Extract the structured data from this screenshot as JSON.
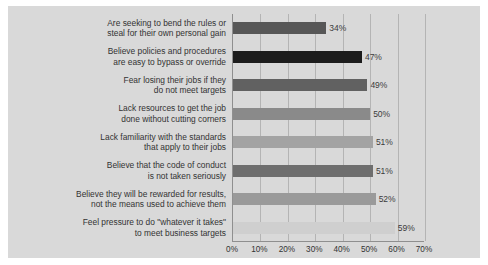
{
  "chart_data": {
    "type": "bar",
    "orientation": "horizontal",
    "title": "",
    "subtitle": "",
    "xlabel": "",
    "ylabel": "",
    "xlim": [
      0,
      70
    ],
    "grid": true,
    "legend": false,
    "xticks": [
      "0%",
      "10%",
      "20%",
      "30%",
      "40%",
      "50%",
      "60%",
      "70%"
    ],
    "xtick_values": [
      0,
      10,
      20,
      30,
      40,
      50,
      60,
      70
    ],
    "categories": [
      "Are seeking to bend the rules or steal for their own personal gain",
      "Believe policies and procedures are easy to bypass or override",
      "Fear losing their jobs if they do not meet targets",
      "Lack resources to get the job done without cutting corners",
      "Lack familiarity with the standards that apply to their jobs",
      "Believe that the code of conduct is not taken seriously",
      "Believe they will be rewarded for results, not the means used to achieve them",
      "Feel pressure to do \"whatever it takes\" to meet business targets"
    ],
    "category_lines": [
      [
        "Are seeking to bend the rules or",
        "steal for their own personal gain"
      ],
      [
        "Believe policies and procedures",
        "are easy to bypass or override"
      ],
      [
        "Fear losing their jobs if they",
        "do not meet targets"
      ],
      [
        "Lack resources to get the job",
        "done without cutting corners"
      ],
      [
        "Lack familiarity with the standards",
        "that apply to their jobs"
      ],
      [
        "Believe that the code of conduct",
        "is not taken seriously"
      ],
      [
        "Believe they will be rewarded for results,",
        "not the means used to achieve them"
      ],
      [
        "Feel pressure to do \"whatever it takes\"",
        "to meet business targets"
      ]
    ],
    "values": [
      34,
      47,
      49,
      50,
      51,
      51,
      52,
      59
    ],
    "value_labels": [
      "34%",
      "47%",
      "49%",
      "50%",
      "51%",
      "51%",
      "52%",
      "59%"
    ],
    "bar_colors": [
      "#575757",
      "#1c1c1c",
      "#616161",
      "#8a8a8a",
      "#a3a3a3",
      "#6e6e6e",
      "#9a9a9a",
      "#cfcfcf"
    ]
  },
  "style": {
    "figure_background": "#d9d9d9",
    "page_background": "#ffffff",
    "axis_color": "#8f8f8f",
    "gridline_color": "#b4b4b4",
    "text_color": "#333333"
  }
}
